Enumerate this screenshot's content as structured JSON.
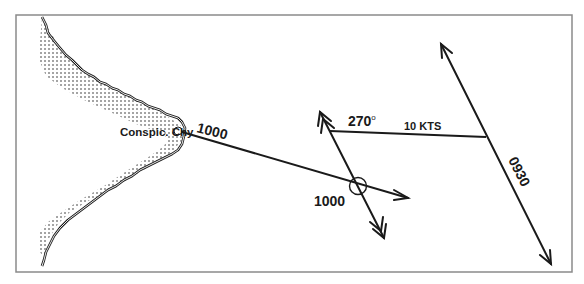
{
  "diagram": {
    "type": "navigation-chart-plot",
    "colors": {
      "ink": "#1a1a1a",
      "border": "#8a8a8a",
      "background": "#ffffff"
    },
    "landmark": {
      "label": "Conspic. Chy"
    },
    "bearing_line": {
      "time_label": "1000"
    },
    "fix": {
      "time_label": "1000"
    },
    "tide_vector": {
      "direction_label": "270",
      "degree_symbol": "o",
      "speed_label": "10 KTS"
    },
    "earlier_position_line": {
      "time_label": "0930"
    }
  }
}
